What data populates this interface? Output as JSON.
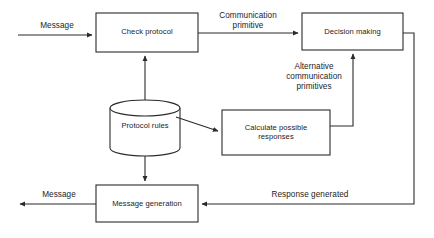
{
  "diagram": {
    "stroke_color": "#2b2b2b",
    "text_color": "#1c1c1c",
    "background_color": "#ffffff",
    "nodes": [
      {
        "id": "check-protocol",
        "shape": "rectangle",
        "label": "Check protocol",
        "x": 96,
        "y": 13,
        "w": 102,
        "h": 39
      },
      {
        "id": "decision-making",
        "shape": "rectangle",
        "label": "Decision making",
        "x": 302,
        "y": 13,
        "w": 101,
        "h": 37
      },
      {
        "id": "protocol-rules",
        "shape": "cylinder",
        "label": "Protocol rules",
        "x": 110,
        "y": 100,
        "w": 70,
        "h": 56
      },
      {
        "id": "calculate-possible-responses",
        "shape": "rectangle",
        "label": "Calculate possible\nresponses",
        "x": 222,
        "y": 110,
        "w": 108,
        "h": 45
      },
      {
        "id": "message-generation",
        "shape": "rectangle",
        "label": "Message generation",
        "x": 96,
        "y": 185,
        "w": 102,
        "h": 37
      }
    ],
    "edges": [
      {
        "id": "message-in",
        "label": "Message",
        "from": "external-input",
        "to": "check-protocol"
      },
      {
        "id": "communication-primitive",
        "label": "Communication\nprimitive",
        "from": "check-protocol",
        "to": "decision-making"
      },
      {
        "id": "alternative-primitives",
        "label": "Alternative\ncommunication\nprimitives",
        "from": "calculate-possible-responses",
        "to": "decision-making"
      },
      {
        "id": "protocol-rules-to-check",
        "label": "",
        "from": "protocol-rules",
        "to": "check-protocol"
      },
      {
        "id": "protocol-rules-to-calculate",
        "label": "",
        "from": "protocol-rules",
        "to": "calculate-possible-responses"
      },
      {
        "id": "protocol-rules-to-message-generation",
        "label": "",
        "from": "protocol-rules",
        "to": "message-generation"
      },
      {
        "id": "response-generated",
        "label": "Response generated",
        "from": "decision-making",
        "to": "message-generation"
      },
      {
        "id": "message-out",
        "label": "Message",
        "from": "message-generation",
        "to": "external-output"
      }
    ]
  }
}
